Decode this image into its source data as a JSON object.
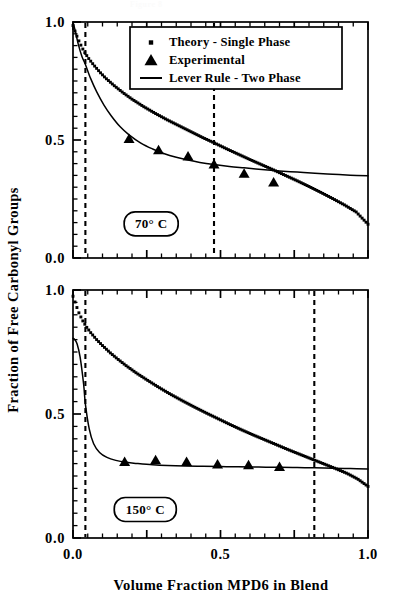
{
  "figure": {
    "clipped_caption": "Figure 8",
    "axis_titles": {
      "y": "Fraction of Free Carbonyl Groups",
      "x": "Volume Fraction MPD6 in Blend"
    },
    "tick_labels": {
      "y": [
        "1.0",
        "0.5",
        "0.0"
      ],
      "x": [
        "0.0",
        "0.5",
        "1.0"
      ]
    },
    "legend": {
      "items": [
        {
          "label": "Theory - Single Phase",
          "marker": "square-dot"
        },
        {
          "label": "Experimental",
          "marker": "triangle"
        },
        {
          "label": "Lever Rule - Two Phase",
          "marker": "line"
        }
      ]
    },
    "panels": [
      {
        "id": "panel-top",
        "label": "70° C"
      },
      {
        "id": "panel-bottom",
        "label": "150° C"
      }
    ]
  },
  "chart_data": [
    {
      "type": "scatter",
      "id": "panel-top",
      "title": "70° C",
      "xlabel": "Volume Fraction MPD6 in Blend",
      "ylabel": "Fraction of Free Carbonyl Groups",
      "xlim": [
        0.0,
        1.0
      ],
      "ylim": [
        0.0,
        1.0
      ],
      "xticks": [
        0.0,
        0.5,
        1.0
      ],
      "yticks": [
        0.0,
        0.5,
        1.0
      ],
      "minor_tick_step": 0.05,
      "grid": false,
      "legend_position": "top-center",
      "annotations": [
        {
          "text": "70° C",
          "x": 0.265,
          "y": 0.145,
          "style": "rounded-box"
        }
      ],
      "vertical_dashed_lines": [
        0.042,
        0.478
      ],
      "series": [
        {
          "name": "Theory - Single Phase",
          "marker": "square-dot",
          "x": [
            0.0,
            0.01,
            0.02,
            0.03,
            0.04,
            0.055,
            0.07,
            0.09,
            0.11,
            0.14,
            0.17,
            0.2,
            0.24,
            0.28,
            0.32,
            0.36,
            0.4,
            0.44,
            0.48,
            0.52,
            0.56,
            0.6,
            0.64,
            0.68,
            0.72,
            0.76,
            0.8,
            0.84,
            0.88,
            0.92,
            0.96,
            1.0
          ],
          "y": [
            0.985,
            0.95,
            0.92,
            0.893,
            0.87,
            0.842,
            0.818,
            0.789,
            0.763,
            0.73,
            0.7,
            0.673,
            0.641,
            0.612,
            0.585,
            0.56,
            0.535,
            0.51,
            0.487,
            0.463,
            0.44,
            0.417,
            0.395,
            0.373,
            0.35,
            0.327,
            0.303,
            0.278,
            0.252,
            0.225,
            0.195,
            0.143
          ]
        },
        {
          "name": "Lever Rule - Two Phase",
          "marker": "line",
          "x": [
            0.0,
            0.008,
            0.018,
            0.03,
            0.042,
            0.06,
            0.08,
            0.105,
            0.13,
            0.16,
            0.19,
            0.23,
            0.27,
            0.31,
            0.35,
            0.39,
            0.43,
            0.478,
            0.53,
            0.58,
            0.64,
            0.7,
            0.76,
            0.82,
            0.88,
            0.94,
            1.0
          ],
          "y": [
            1.0,
            0.96,
            0.905,
            0.855,
            0.82,
            0.76,
            0.705,
            0.648,
            0.602,
            0.556,
            0.522,
            0.487,
            0.462,
            0.442,
            0.427,
            0.415,
            0.405,
            0.396,
            0.388,
            0.382,
            0.375,
            0.369,
            0.364,
            0.359,
            0.355,
            0.351,
            0.348
          ]
        },
        {
          "name": "Experimental",
          "marker": "triangle",
          "x": [
            0.19,
            0.29,
            0.39,
            0.478,
            0.58,
            0.68
          ],
          "y": [
            0.503,
            0.455,
            0.428,
            0.395,
            0.355,
            0.318
          ]
        }
      ]
    },
    {
      "type": "scatter",
      "id": "panel-bottom",
      "title": "150° C",
      "xlabel": "Volume Fraction MPD6 in Blend",
      "ylabel": "Fraction of Free Carbonyl Groups",
      "xlim": [
        0.0,
        1.0
      ],
      "ylim": [
        0.0,
        1.0
      ],
      "xticks": [
        0.0,
        0.5,
        1.0
      ],
      "yticks": [
        0.0,
        0.5,
        1.0
      ],
      "minor_tick_step": 0.05,
      "grid": false,
      "legend_position": "none",
      "annotations": [
        {
          "text": "150° C",
          "x": 0.245,
          "y": 0.115,
          "style": "rounded-box"
        }
      ],
      "vertical_dashed_lines": [
        0.042,
        0.818
      ],
      "series": [
        {
          "name": "Theory - Single Phase",
          "marker": "square-dot",
          "x": [
            0.0,
            0.01,
            0.02,
            0.032,
            0.045,
            0.06,
            0.08,
            0.1,
            0.125,
            0.15,
            0.18,
            0.215,
            0.25,
            0.29,
            0.33,
            0.37,
            0.41,
            0.45,
            0.49,
            0.53,
            0.57,
            0.61,
            0.65,
            0.69,
            0.73,
            0.77,
            0.81,
            0.85,
            0.89,
            0.93,
            0.965,
            1.0
          ],
          "y": [
            0.975,
            0.94,
            0.908,
            0.878,
            0.852,
            0.828,
            0.8,
            0.776,
            0.748,
            0.723,
            0.695,
            0.665,
            0.638,
            0.608,
            0.58,
            0.554,
            0.529,
            0.505,
            0.482,
            0.459,
            0.437,
            0.416,
            0.396,
            0.376,
            0.356,
            0.337,
            0.318,
            0.299,
            0.28,
            0.26,
            0.238,
            0.208
          ]
        },
        {
          "name": "Lever Rule - Two Phase",
          "marker": "line",
          "x": [
            0.0,
            0.006,
            0.014,
            0.024,
            0.036,
            0.042,
            0.055,
            0.07,
            0.09,
            0.115,
            0.145,
            0.18,
            0.22,
            0.27,
            0.32,
            0.38,
            0.44,
            0.5,
            0.56,
            0.63,
            0.7,
            0.76,
            0.818,
            0.88,
            0.94,
            1.0
          ],
          "y": [
            0.805,
            0.8,
            0.782,
            0.73,
            0.62,
            0.54,
            0.44,
            0.38,
            0.345,
            0.325,
            0.313,
            0.305,
            0.3,
            0.295,
            0.292,
            0.29,
            0.289,
            0.288,
            0.287,
            0.286,
            0.285,
            0.284,
            0.283,
            0.281,
            0.28,
            0.278
          ]
        },
        {
          "name": "Experimental",
          "marker": "triangle",
          "x": [
            0.175,
            0.28,
            0.385,
            0.49,
            0.595,
            0.7
          ],
          "y": [
            0.305,
            0.312,
            0.305,
            0.295,
            0.292,
            0.285
          ]
        }
      ]
    }
  ]
}
